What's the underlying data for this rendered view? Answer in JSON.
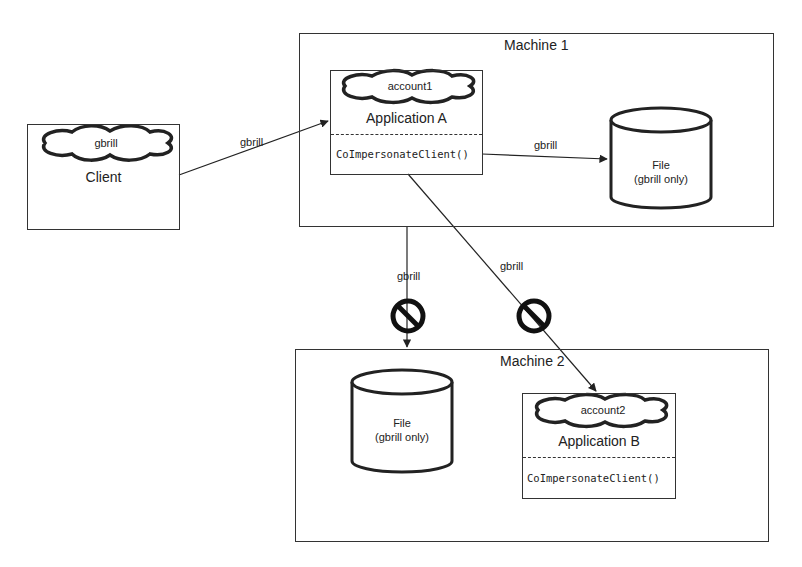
{
  "diagram": {
    "machines": [
      {
        "id": "machine1",
        "label": "Machine 1"
      },
      {
        "id": "machine2",
        "label": "Machine 2"
      }
    ],
    "client": {
      "identity": "gbrill",
      "label": "Client"
    },
    "application_a": {
      "identity": "account1",
      "label": "Application A",
      "method": "CoImpersonateClient()"
    },
    "application_b": {
      "identity": "account2",
      "label": "Application B",
      "method": "CoImpersonateClient()"
    },
    "file_machine1": {
      "title": "File",
      "subtitle": "(gbrill only)"
    },
    "file_machine2": {
      "title": "File",
      "subtitle": "(gbrill only)"
    },
    "edges": [
      {
        "from": "client",
        "to": "application_a",
        "label": "gbrill",
        "blocked": false
      },
      {
        "from": "application_a",
        "to": "file_machine1",
        "label": "gbrill",
        "blocked": false
      },
      {
        "from": "application_a",
        "to": "file_machine2",
        "label": "gbrill",
        "blocked": true
      },
      {
        "from": "application_a",
        "to": "application_b",
        "label": "gbrill",
        "blocked": true
      }
    ],
    "icons": {
      "blocked": "no-entry-icon",
      "identity": "cloud-icon",
      "storage": "cylinder-icon"
    }
  }
}
